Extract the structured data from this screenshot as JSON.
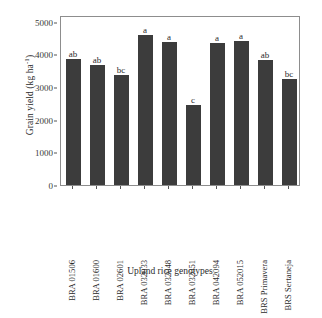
{
  "chart_data": {
    "type": "bar",
    "title": "",
    "xlabel": "Upland rice genotypes",
    "ylabel": "Grain yield (kg ha",
    "ylabel_exponent": "-1",
    "ylabel_suffix": ")",
    "categories": [
      "BRA 01506",
      "BRA 01600",
      "BRA 02601",
      "BRA 032033",
      "BRA 032048",
      "BRA 032051",
      "BRA 042094",
      "BRA 052015",
      "BRS Primavera",
      "BRS Sertaneja"
    ],
    "values": [
      3860,
      3680,
      3380,
      4600,
      4370,
      2450,
      4350,
      4390,
      3820,
      3250
    ],
    "annotations": [
      "ab",
      "ab",
      "bc",
      "a",
      "a",
      "c",
      "a",
      "a",
      "ab",
      "bc"
    ],
    "ylim": [
      0,
      5200
    ],
    "yticks": [
      0,
      1000,
      2000,
      3000,
      4000,
      5000
    ],
    "ytick_labels": [
      "0",
      "1000",
      "2000",
      "3000",
      "4000",
      "5000"
    ],
    "grid": false,
    "legend": false,
    "bar_color": "#3c3c3c",
    "frame_color": "#8d8d8d",
    "background_color": "#ffffff"
  }
}
